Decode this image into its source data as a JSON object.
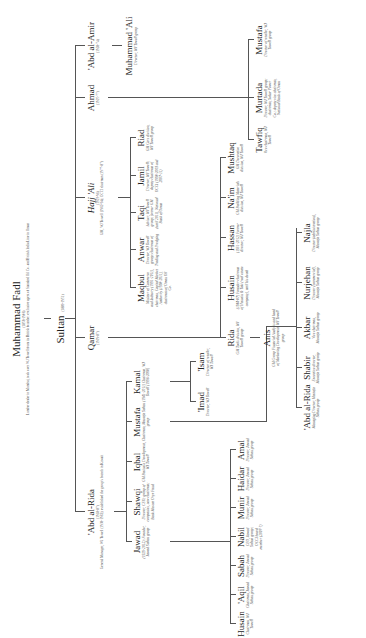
{
  "root": {
    "name": "Muhammad Fadl",
    "dates": "(1858-1906)",
    "caption": "Lumber dealer in Mumbai, took over WJ Towell from its British founder; exclusive agent of Standard Oil Co. and British India Line in Oman"
  },
  "sultan": {
    "name": "Sultan",
    "dates": "(1889-1951)"
  },
  "gen2": [
    {
      "name": "'Abd al-Rida",
      "dates": "(1918-87)",
      "caption": "General Manager, WJ Towell (1938-1962); established the group's branch in Kuwait"
    },
    {
      "name": "Qamar",
      "dates": "(1919-87)"
    },
    {
      "name": "Hajj 'Ali",
      "dates": "(1923-96)",
      "caption": "GM, WJ Towell (1962-94); OCCI chairman (1977-87)"
    },
    {
      "name": "Ahmad",
      "dates": "(1925-77)"
    },
    {
      "name": "'Abd al-Amir",
      "dates": "(1928-74)"
    }
  ],
  "abdalrida_children": [
    {
      "name": "Jawad",
      "desc": "(1929-2012); Founder, Jawad Sultan group"
    },
    {
      "name": "Shawqi",
      "desc": "Director, CEO; group of companies, now chairman; Bank Muscat Oryx Fund"
    },
    {
      "name": "Iqbal",
      "desc": "GM Business Development, WJ Towell"
    },
    {
      "name": "Mustafa",
      "desc": "Chairman, Mustafa Sultan group"
    },
    {
      "name": "Kamal",
      "desc": "(1941-2011) Chairman, WJ Towell (1996-2008)"
    }
  ],
  "jawad_children": [
    {
      "name": "Husain",
      "desc": "Chairman, WJ Towell"
    },
    {
      "name": "'Aqil",
      "desc": "Chairman, Jawad Sultan group"
    },
    {
      "name": "Sabah",
      "desc": "Director, Jawad Sultan group"
    },
    {
      "name": "Nabil",
      "desc": "CEO, Jawad Sultan group; OCCI board member (2007-?)"
    },
    {
      "name": "Munir",
      "desc": "Director, Jawad Sultan group"
    },
    {
      "name": "Haidar",
      "desc": "Director, Jawad Sultan group"
    },
    {
      "name": "Amal",
      "desc": "Director, Jawad Sultan group"
    }
  ],
  "kamal_children": [
    {
      "name": "'Imad",
      "desc": "Director, WJ Towell"
    },
    {
      "name": "'Isam",
      "desc": "Director of retailer, WJ Towell"
    }
  ],
  "mustafa_children": [
    {
      "name": "'Abd al-Rida",
      "desc": "Managing Director, Mustafa Sultan group"
    },
    {
      "name": "Shabir",
      "desc": "Executive director, Mustafa Sultan group"
    },
    {
      "name": "Akbar",
      "desc": "Vice chairman, Mustafa Sultan group"
    },
    {
      "name": "Nurjehan",
      "desc": "Director (commercial), Mustafa Sultan group"
    },
    {
      "name": "Najla",
      "desc": "Director (administration), Mustafa Sultan group"
    }
  ],
  "qamar_children": [
    {
      "name": "Rida",
      "desc": "GM Tools division, WJ Towell group"
    },
    {
      "name": "Husain",
      "desc": "(1944-87) Founder-chairman of Hussain & Taki (real estate company), until his death"
    },
    {
      "name": "Hassan",
      "desc": "(1951-2012) Former director, WJ Towell"
    },
    {
      "name": "Na'im",
      "desc": "GM Building Materials division, WJ Towell"
    },
    {
      "name": "Mushtaq",
      "desc": "GM Decorative division, WJ Towell"
    }
  ],
  "rida_children": [
    {
      "name": "Anis",
      "desc": "GM Group Financial Analysis and head of Marketing Development, WJ Towell group"
    }
  ],
  "hajjali_children": [
    {
      "name": "Maqbul",
      "desc": "Minister of Commerce and Industry (1991-2011), chairman, Capital Market Authority (1998-2011), chairman of Oman Oil Co."
    },
    {
      "name": "Anwar",
      "desc": "Director, WJ Towell group; chairman of Trading and Dredging"
    },
    {
      "name": "Taqi",
      "desc": "Adviser, WJ Towell group; former GM (until 2011), National Bank of Oman"
    },
    {
      "name": "Jamil",
      "desc": "Director, WJ Towell; deputy chairman of OCCI (1998-2003 and 2007-11)"
    },
    {
      "name": "Riad",
      "desc": "GM Cars division, WJ Towell group"
    }
  ],
  "ahmad_children": [
    {
      "name": "Tawfiq",
      "desc": "Vice chairman, WJ Towell"
    },
    {
      "name": "Murtada",
      "desc": "Director, WJ Towell group; chairman, Sohar Power Co.; deputy vice chairman, National Bank of Oman"
    },
    {
      "name": "Mustafa",
      "desc": "Director of retailer, WJ Towell group"
    }
  ],
  "abdalamir_children": [
    {
      "name": "Muhammad 'Ali",
      "desc": "Director, WJ Towell group"
    }
  ]
}
